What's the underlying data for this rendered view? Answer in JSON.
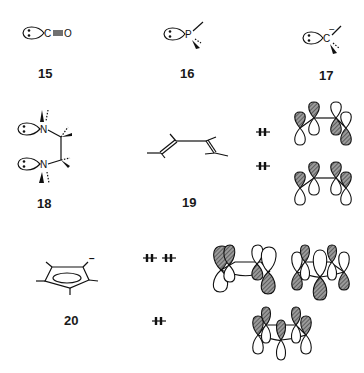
{
  "figure": {
    "compounds": [
      {
        "id": "15",
        "label": "15",
        "atoms": [
          "C",
          "O"
        ],
        "description": "carbon monoxide lone pair on C"
      },
      {
        "id": "16",
        "label": "16",
        "atoms": [
          "P"
        ],
        "description": "phosphine lone pair"
      },
      {
        "id": "17",
        "label": "17",
        "atoms": [
          "C"
        ],
        "charge": "−",
        "description": "carbanion lone pair"
      },
      {
        "id": "18",
        "label": "18",
        "atoms": [
          "N",
          "N"
        ],
        "description": "1,2-diamine with two nitrogen lone pairs"
      },
      {
        "id": "19",
        "label": "19",
        "atoms": [],
        "description": "butadiene with two occupied pi orbitals"
      },
      {
        "id": "20",
        "label": "20",
        "atoms": [],
        "charge": "−",
        "description": "cyclopentadienyl anion with three occupied pi orbitals"
      }
    ],
    "electron_pairs": {
      "compound_19": [
        "⇟",
        "⇟"
      ],
      "compound_20_degenerate": [
        "⇟",
        "⇟"
      ],
      "compound_20_lowest": "⇟"
    },
    "colors": {
      "ink": "#111111",
      "background": "#ffffff",
      "hatch": "#555555"
    }
  }
}
